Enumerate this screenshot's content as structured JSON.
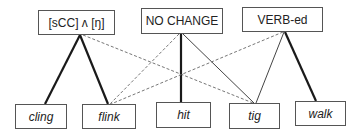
{
  "diagram": {
    "patterns": [
      {
        "id": "p1",
        "label": "[sCC] ʌ [ŋ]",
        "x": 38,
        "y": 10,
        "w": 77,
        "h": 25
      },
      {
        "id": "p2",
        "label": "NO CHANGE",
        "x": 141,
        "y": 8,
        "w": 82,
        "h": 26
      },
      {
        "id": "p3",
        "label": "VERB-ed",
        "x": 242,
        "y": 7,
        "w": 81,
        "h": 25
      }
    ],
    "words": [
      {
        "id": "w1",
        "label": "cling",
        "x": 15,
        "y": 104,
        "w": 52,
        "h": 25
      },
      {
        "id": "w2",
        "label": "flink",
        "x": 82,
        "y": 104,
        "w": 54,
        "h": 25
      },
      {
        "id": "w3",
        "label": "hit",
        "x": 156,
        "y": 102,
        "w": 55,
        "h": 26
      },
      {
        "id": "w4",
        "label": "tig",
        "x": 229,
        "y": 103,
        "w": 51,
        "h": 26
      },
      {
        "id": "w5",
        "label": "walk",
        "x": 295,
        "y": 101,
        "w": 51,
        "h": 25
      }
    ],
    "links": [
      {
        "from": "[sCC] ʌ [ŋ]",
        "to": "cling",
        "style": "thick",
        "x1": 80,
        "y1": 35,
        "x2": 45,
        "y2": 104
      },
      {
        "from": "[sCC] ʌ [ŋ]",
        "to": "flink",
        "style": "thick",
        "x1": 80,
        "y1": 35,
        "x2": 108,
        "y2": 104
      },
      {
        "from": "[sCC] ʌ [ŋ]",
        "to": "tig",
        "style": "dashed",
        "x1": 83,
        "y1": 35,
        "x2": 253,
        "y2": 103
      },
      {
        "from": "NO CHANGE",
        "to": "flink",
        "style": "dashed",
        "x1": 179,
        "y1": 34,
        "x2": 110,
        "y2": 104
      },
      {
        "from": "NO CHANGE",
        "to": "hit",
        "style": "thick",
        "x1": 181,
        "y1": 34,
        "x2": 181,
        "y2": 102
      },
      {
        "from": "NO CHANGE",
        "to": "tig",
        "style": "thin",
        "x1": 183,
        "y1": 34,
        "x2": 254,
        "y2": 103
      },
      {
        "from": "VERB-ed",
        "to": "flink",
        "style": "dashed",
        "x1": 283,
        "y1": 32,
        "x2": 111,
        "y2": 104
      },
      {
        "from": "VERB-ed",
        "to": "tig",
        "style": "thin",
        "x1": 284,
        "y1": 32,
        "x2": 256,
        "y2": 103
      },
      {
        "from": "VERB-ed",
        "to": "walk",
        "style": "thick",
        "x1": 285,
        "y1": 32,
        "x2": 316,
        "y2": 101
      }
    ],
    "styles": {
      "thick": {
        "stroke": "#1a1a1a",
        "width": 2.2,
        "dash": ""
      },
      "thin": {
        "stroke": "#444444",
        "width": 1,
        "dash": ""
      },
      "dashed": {
        "stroke": "#777777",
        "width": 1,
        "dash": "3,2"
      }
    }
  }
}
